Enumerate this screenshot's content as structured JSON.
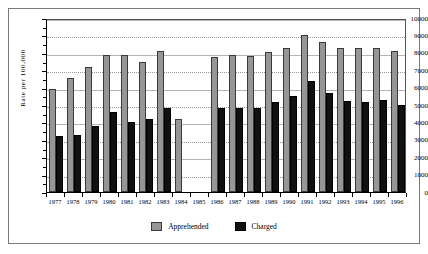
{
  "chart_data": {
    "type": "bar",
    "title": "",
    "xlabel": "",
    "ylabel": "Rate per 100,000",
    "ylim": [
      0,
      10000
    ],
    "ytick_step": 1000,
    "yticks": [
      0,
      1000,
      2000,
      3000,
      4000,
      5000,
      6000,
      7000,
      8000,
      9000,
      10000
    ],
    "ytick_labels": [
      "0",
      "1000",
      "2000",
      "3000",
      "4000",
      "5000",
      "6000",
      "7000",
      "8000",
      "9000",
      "10000"
    ],
    "grid": true,
    "legend_position": "bottom-center",
    "categories": [
      "1977",
      "1978",
      "1979",
      "1980",
      "1981",
      "1982",
      "1983",
      "1984",
      "1985",
      "1986",
      "1987",
      "1988",
      "1989",
      "1990",
      "1991",
      "1992",
      "1993",
      "1994",
      "1995",
      "1996"
    ],
    "series": [
      {
        "name": "Apprehended",
        "color": "#969696",
        "values": [
          5900,
          6550,
          7200,
          7900,
          7900,
          7500,
          8100,
          4200,
          null,
          7750,
          7900,
          7800,
          8050,
          8300,
          9000,
          8600,
          8300,
          8300,
          8300,
          8100
        ]
      },
      {
        "name": "Charged",
        "color": "#111111",
        "values": [
          3200,
          3300,
          3800,
          4600,
          4050,
          4200,
          4800,
          null,
          null,
          4800,
          4800,
          4800,
          5200,
          5500,
          6400,
          5700,
          5250,
          5200,
          5300,
          5000
        ]
      }
    ]
  },
  "legend": {
    "items": [
      {
        "label": "Apprehended",
        "swatch": "apprehended-swatch"
      },
      {
        "label": "Charged",
        "swatch": "charged-swatch"
      }
    ]
  }
}
